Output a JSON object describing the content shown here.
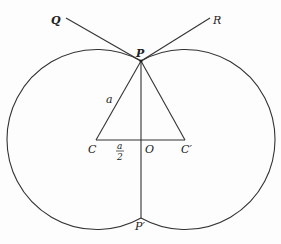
{
  "diagram": {
    "type": "geometry",
    "colors": {
      "stroke": "#333333",
      "background": "#fdfdfd",
      "text": "#222222"
    },
    "points": {
      "P": {
        "label": "P",
        "x": 141,
        "y": 61
      },
      "P_prime": {
        "label": "P′",
        "x": 141,
        "y": 218
      },
      "C": {
        "label": "C",
        "x": 96,
        "y": 140
      },
      "O": {
        "label": "O",
        "x": 141,
        "y": 140
      },
      "C_prime": {
        "label": "C′",
        "x": 185,
        "y": 140
      },
      "Q": {
        "label": "Q",
        "x": 66,
        "y": 18
      },
      "R": {
        "label": "R",
        "x": 210,
        "y": 18
      }
    },
    "labels": {
      "side_a": "a",
      "half_a_num": "a",
      "half_a_den": "2"
    },
    "circles": [
      {
        "center": "C",
        "radius": 90
      },
      {
        "center": "C_prime",
        "radius": 90
      }
    ],
    "segments": [
      [
        "Q",
        "P"
      ],
      [
        "R",
        "P"
      ],
      [
        "P",
        "C"
      ],
      [
        "P",
        "C_prime"
      ],
      [
        "C",
        "C_prime"
      ],
      [
        "P",
        "P_prime"
      ]
    ]
  }
}
